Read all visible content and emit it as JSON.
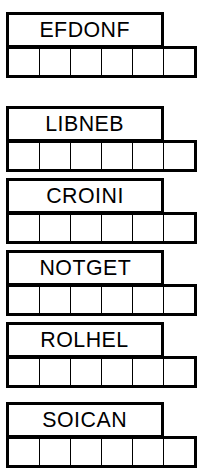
{
  "sheet": {
    "title": "Word Scramble Puzzle Sheet",
    "columns": 6,
    "ink_color": "#000000",
    "paper_color": "#ffffff"
  },
  "puzzles": [
    {
      "id": "puzzle-1",
      "word": "EFDONF",
      "letters": 6,
      "answer_cells": [
        {
          "index": 1,
          "circled": false,
          "letter": ""
        },
        {
          "index": 2,
          "circled": false,
          "letter": ""
        },
        {
          "index": 3,
          "circled": false,
          "letter": ""
        },
        {
          "index": 4,
          "circled": true,
          "letter": ""
        },
        {
          "index": 5,
          "circled": true,
          "letter": ""
        },
        {
          "index": 6,
          "circled": true,
          "letter": ""
        }
      ]
    },
    {
      "id": "puzzle-2",
      "word": "LIBNEB",
      "letters": 6,
      "answer_cells": [
        {
          "index": 1,
          "circled": true,
          "letter": ""
        },
        {
          "index": 2,
          "circled": true,
          "letter": ""
        },
        {
          "index": 3,
          "circled": false,
          "letter": ""
        },
        {
          "index": 4,
          "circled": false,
          "letter": ""
        },
        {
          "index": 5,
          "circled": false,
          "letter": ""
        },
        {
          "index": 6,
          "circled": false,
          "letter": ""
        }
      ]
    },
    {
      "id": "puzzle-3",
      "word": "CROINI",
      "letters": 6,
      "answer_cells": [
        {
          "index": 1,
          "circled": true,
          "letter": ""
        },
        {
          "index": 2,
          "circled": false,
          "letter": ""
        },
        {
          "index": 3,
          "circled": false,
          "letter": ""
        },
        {
          "index": 4,
          "circled": false,
          "letter": ""
        },
        {
          "index": 5,
          "circled": true,
          "letter": ""
        },
        {
          "index": 6,
          "circled": false,
          "letter": ""
        }
      ]
    },
    {
      "id": "puzzle-4",
      "word": "NOTGET",
      "letters": 6,
      "answer_cells": [
        {
          "index": 1,
          "circled": true,
          "letter": ""
        },
        {
          "index": 2,
          "circled": true,
          "letter": ""
        },
        {
          "index": 3,
          "circled": false,
          "letter": ""
        },
        {
          "index": 4,
          "circled": true,
          "letter": ""
        },
        {
          "index": 5,
          "circled": false,
          "letter": ""
        },
        {
          "index": 6,
          "circled": false,
          "letter": ""
        }
      ]
    },
    {
      "id": "puzzle-5",
      "word": "ROLHEL",
      "letters": 6,
      "answer_cells": [
        {
          "index": 1,
          "circled": true,
          "letter": ""
        },
        {
          "index": 2,
          "circled": true,
          "letter": ""
        },
        {
          "index": 3,
          "circled": false,
          "letter": ""
        },
        {
          "index": 4,
          "circled": false,
          "letter": ""
        },
        {
          "index": 5,
          "circled": false,
          "letter": ""
        },
        {
          "index": 6,
          "circled": true,
          "letter": ""
        }
      ]
    },
    {
      "id": "puzzle-6",
      "word": "SOICAN",
      "letters": 6,
      "answer_cells": [
        {
          "index": 1,
          "circled": true,
          "letter": ""
        },
        {
          "index": 2,
          "circled": false,
          "letter": ""
        },
        {
          "index": 3,
          "circled": false,
          "letter": ""
        },
        {
          "index": 4,
          "circled": true,
          "letter": ""
        },
        {
          "index": 5,
          "circled": true,
          "letter": ""
        },
        {
          "index": 6,
          "circled": false,
          "letter": ""
        }
      ]
    }
  ],
  "layout": {
    "block_tops": [
      12,
      106,
      178,
      250,
      322,
      402
    ]
  }
}
